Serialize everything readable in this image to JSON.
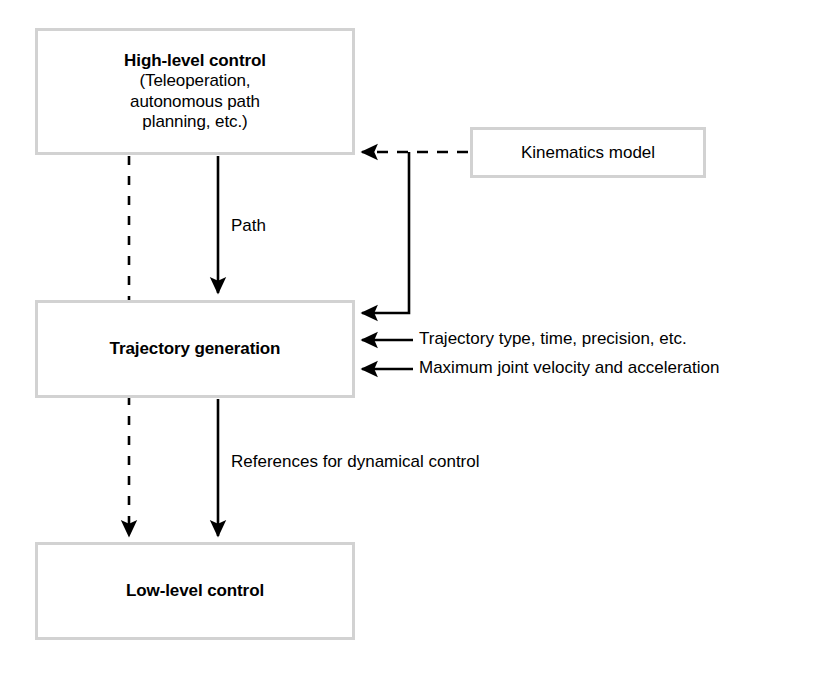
{
  "diagram": {
    "stroke_color": "#000000",
    "box_border_color": "#d2d2d2",
    "background": "#ffffff",
    "nodes": [
      {
        "id": "high-level-control",
        "title": "High-level control",
        "subtitle_lines": [
          "(Teleoperation,",
          "autonomous path",
          "planning, etc.)"
        ],
        "title_bold": true
      },
      {
        "id": "kinematics-model",
        "title": "Kinematics model",
        "title_bold": false
      },
      {
        "id": "trajectory-generation",
        "title": "Trajectory generation",
        "title_bold": true
      },
      {
        "id": "low-level-control",
        "title": "Low-level control",
        "title_bold": true
      }
    ],
    "edges": [
      {
        "id": "path",
        "label": "Path",
        "from": "high-level-control",
        "to": "trajectory-generation",
        "style": "solid",
        "arrow": true
      },
      {
        "id": "high-level-to-low-level-dashed",
        "label": "",
        "from": "high-level-control",
        "to": "low-level-control",
        "style": "dashed",
        "arrow": true
      },
      {
        "id": "references-for-dynamical-control",
        "label": "References for dynamical control",
        "from": "trajectory-generation",
        "to": "low-level-control",
        "style": "solid",
        "arrow": true
      },
      {
        "id": "kinematics-to-high-level",
        "label": "",
        "from": "kinematics-model",
        "to": "high-level-control",
        "style": "dashed",
        "arrow": true
      },
      {
        "id": "kinematics-to-trajectory",
        "label": "",
        "from": "kinematics-model",
        "to": "trajectory-generation",
        "style": "solid",
        "arrow": true
      },
      {
        "id": "trajectory-type-input",
        "label": "Trajectory type, time, precision, etc.",
        "from": "",
        "to": "trajectory-generation",
        "style": "solid",
        "arrow": true
      },
      {
        "id": "maximum-joint-input",
        "label": "Maximum joint velocity and acceleration",
        "from": "",
        "to": "trajectory-generation",
        "style": "solid",
        "arrow": true
      }
    ]
  }
}
